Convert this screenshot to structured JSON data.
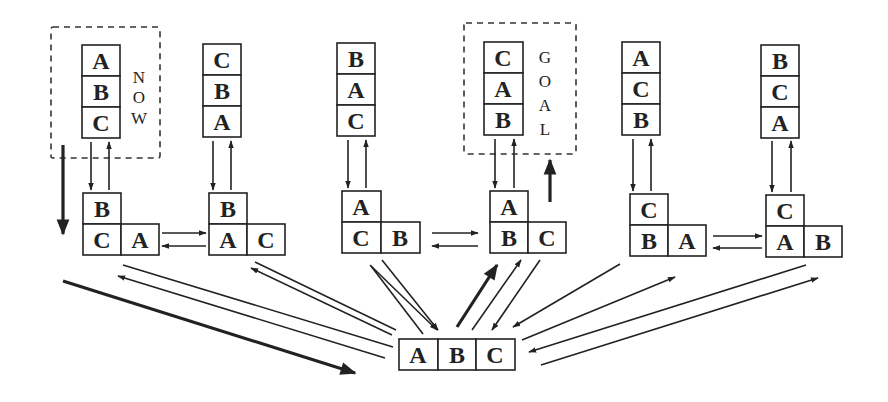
{
  "diagram": {
    "labels": {
      "now": [
        "N",
        "O",
        "W"
      ],
      "goal": [
        "G",
        "O",
        "A",
        "L"
      ]
    },
    "towers": [
      {
        "id": "t1",
        "blocks_top_to_bottom": [
          "A",
          "B",
          "C"
        ],
        "tag": "NOW"
      },
      {
        "id": "t2",
        "blocks_top_to_bottom": [
          "C",
          "B",
          "A"
        ]
      },
      {
        "id": "t3",
        "blocks_top_to_bottom": [
          "B",
          "A",
          "C"
        ]
      },
      {
        "id": "t4",
        "blocks_top_to_bottom": [
          "C",
          "A",
          "B"
        ],
        "tag": "GOAL"
      },
      {
        "id": "t5",
        "blocks_top_to_bottom": [
          "A",
          "C",
          "B"
        ]
      },
      {
        "id": "t6",
        "blocks_top_to_bottom": [
          "B",
          "C",
          "A"
        ]
      }
    ],
    "pairs": [
      {
        "id": "p1",
        "top": "B",
        "bottom_left": "C",
        "bottom_right": "A"
      },
      {
        "id": "p2",
        "top": "B",
        "bottom_left": "A",
        "bottom_right": "C"
      },
      {
        "id": "p3",
        "top": "A",
        "bottom_left": "C",
        "bottom_right": "B"
      },
      {
        "id": "p4",
        "top": "A",
        "bottom_left": "B",
        "bottom_right": "C"
      },
      {
        "id": "p5",
        "top": "C",
        "bottom_left": "B",
        "bottom_right": "A"
      },
      {
        "id": "p6",
        "top": "C",
        "bottom_left": "A",
        "bottom_right": "B"
      }
    ],
    "flat": {
      "id": "f",
      "blocks": [
        "A",
        "B",
        "C"
      ]
    },
    "path_highlight": "NOW → flat table → GOAL (bold arrows)"
  }
}
